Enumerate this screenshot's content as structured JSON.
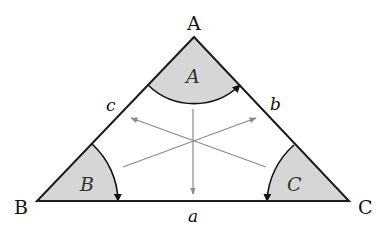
{
  "diagram": {
    "type": "triangle",
    "vertices": [
      {
        "name": "A",
        "label": "A",
        "x": 194,
        "y": 37
      },
      {
        "name": "B",
        "label": "B",
        "x": 37,
        "y": 201
      },
      {
        "name": "C",
        "label": "C",
        "x": 349,
        "y": 201
      }
    ],
    "sides": [
      {
        "name": "a",
        "label": "a",
        "between": [
          "B",
          "C"
        ]
      },
      {
        "name": "b",
        "label": "b",
        "between": [
          "A",
          "C"
        ]
      },
      {
        "name": "c",
        "label": "c",
        "between": [
          "A",
          "B"
        ]
      }
    ],
    "angles": [
      {
        "name": "A",
        "label": "A"
      },
      {
        "name": "B",
        "label": "B"
      },
      {
        "name": "C",
        "label": "C"
      }
    ],
    "center_arrows": 3,
    "colors": {
      "edge": "#1a1a1a",
      "angle_fill": "#d6d6d6",
      "arrow": "#8a8a8a"
    }
  }
}
